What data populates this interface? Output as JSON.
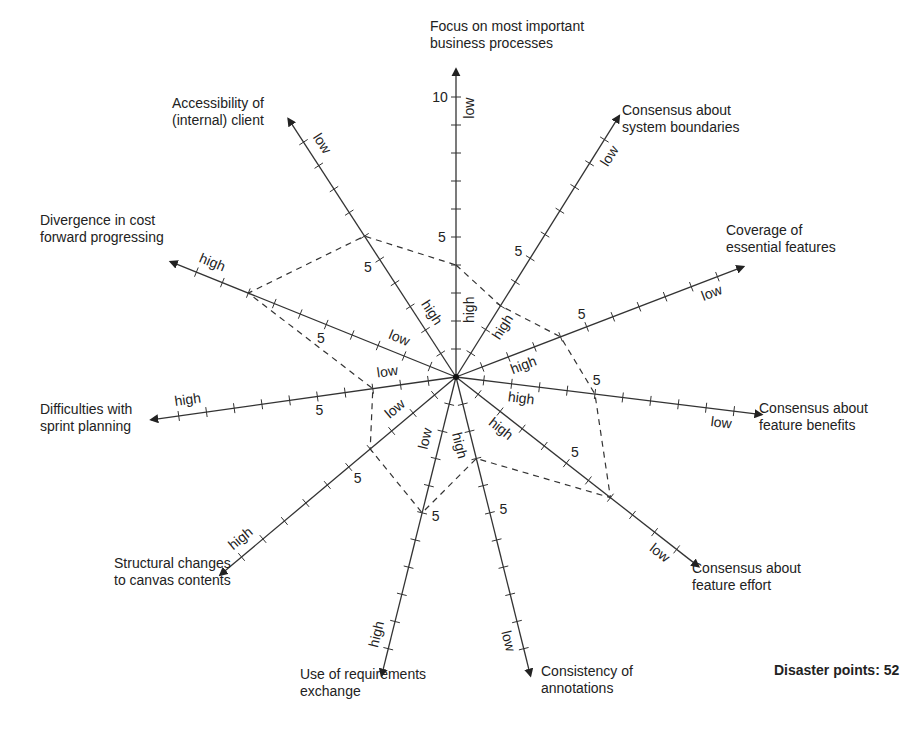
{
  "chart_data": {
    "type": "radar",
    "title": "",
    "scale": {
      "min": 0,
      "max": 10,
      "tick_step": 1,
      "labeled_tick": 5,
      "top_axis_max_label": "10"
    },
    "axes": [
      {
        "name": "Focus on most important business processes",
        "label_lines": [
          "Focus on most important",
          "business processes"
        ],
        "angle": 90,
        "outer_end": "low",
        "inner_end": "high",
        "value": 4
      },
      {
        "name": "Consensus about system boundaries",
        "label_lines": [
          "Consensus about",
          "system boundaries"
        ],
        "angle": 58,
        "outer_end": "low",
        "inner_end": "high",
        "value": 3
      },
      {
        "name": "Coverage of essential features",
        "label_lines": [
          "Coverage of",
          "essential features"
        ],
        "angle": 21,
        "outer_end": "low",
        "inner_end": "high",
        "value": 4
      },
      {
        "name": "Consensus about feature benefits",
        "label_lines": [
          "Consensus about",
          "feature benefits"
        ],
        "angle": -7,
        "outer_end": "low",
        "inner_end": "high",
        "value": 5
      },
      {
        "name": "Consensus about feature effort",
        "label_lines": [
          "Consensus about",
          "feature effort"
        ],
        "angle": -38,
        "outer_end": "low",
        "inner_end": "high",
        "value": 7
      },
      {
        "name": "Consistency of annotations",
        "label_lines": [
          "Consistency of",
          "annotations"
        ],
        "angle": -76,
        "outer_end": "low",
        "inner_end": "high",
        "value": 3
      },
      {
        "name": "Use of requirements exchange",
        "label_lines": [
          "Use of requirements",
          "exchange"
        ],
        "angle": -104,
        "outer_end": "high",
        "inner_end": "low",
        "value": 5
      },
      {
        "name": "Structural changes to canvas contents",
        "label_lines": [
          "Structural changes",
          "to canvas contents"
        ],
        "angle": -140,
        "outer_end": "high",
        "inner_end": "low",
        "value": 4
      },
      {
        "name": "Difficulties with sprint planning",
        "label_lines": [
          "Difficulties with",
          "sprint planning"
        ],
        "angle": -172,
        "outer_end": "high",
        "inner_end": "low",
        "value": 3
      },
      {
        "name": "Divergence in cost forward progressing",
        "label_lines": [
          "Divergence in cost",
          "forward progressing"
        ],
        "angle": 158,
        "outer_end": "high",
        "inner_end": "low",
        "value": 8
      },
      {
        "name": "Accessibility of (internal) client",
        "label_lines": [
          "Accessibility of",
          "(internal) client"
        ],
        "angle": 123,
        "outer_end": "low",
        "inner_end": "high",
        "value": 6
      }
    ],
    "series": [
      {
        "name": "Assessment",
        "style": "dashed"
      }
    ],
    "annotations": [
      "Disaster points: 52"
    ]
  },
  "summary": {
    "disaster_points_label": "Disaster points: 52"
  },
  "caption": "Fig. 10.3  Risk ...",
  "colors": {
    "axis": "#333333",
    "polygon": "#333333",
    "text": "#222222",
    "background": "#ffffff"
  }
}
